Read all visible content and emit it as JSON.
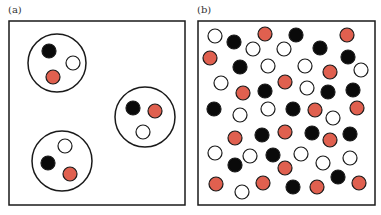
{
  "colors": {
    "black": "#0a0a0a",
    "white": "#ffffff",
    "red": "#e0604f",
    "stroke": "#1a1a1a"
  },
  "panels": [
    {
      "label": "(a)",
      "box": {
        "x": 9,
        "y": 21,
        "w": 176,
        "h": 184
      },
      "clusters": [
        {
          "cx": 57,
          "cy": 63,
          "r": 29,
          "particles": [
            {
              "x": 49,
              "y": 51,
              "type": "black"
            },
            {
              "x": 73,
              "y": 63,
              "type": "white"
            },
            {
              "x": 53,
              "y": 77,
              "type": "red"
            }
          ]
        },
        {
          "cx": 145,
          "cy": 117,
          "r": 30,
          "particles": [
            {
              "x": 133,
              "y": 108,
              "type": "black"
            },
            {
              "x": 155,
              "y": 111,
              "type": "red"
            },
            {
              "x": 143,
              "y": 132,
              "type": "white"
            }
          ]
        },
        {
          "cx": 62,
          "cy": 161,
          "r": 30,
          "particles": [
            {
              "x": 65,
              "y": 146,
              "type": "white"
            },
            {
              "x": 48,
              "y": 163,
              "type": "black"
            },
            {
              "x": 70,
              "y": 174,
              "type": "red"
            }
          ]
        }
      ]
    },
    {
      "label": "(b)",
      "box": {
        "x": 198,
        "y": 21,
        "w": 177,
        "h": 184
      },
      "particles": [
        {
          "x": 215,
          "y": 36,
          "type": "white"
        },
        {
          "x": 234,
          "y": 42,
          "type": "black"
        },
        {
          "x": 265,
          "y": 34,
          "type": "red"
        },
        {
          "x": 253,
          "y": 49,
          "type": "white"
        },
        {
          "x": 284,
          "y": 49,
          "type": "white"
        },
        {
          "x": 296,
          "y": 35,
          "type": "black"
        },
        {
          "x": 320,
          "y": 48,
          "type": "black"
        },
        {
          "x": 347,
          "y": 35,
          "type": "red"
        },
        {
          "x": 348,
          "y": 57,
          "type": "black"
        },
        {
          "x": 210,
          "y": 58,
          "type": "red"
        },
        {
          "x": 240,
          "y": 67,
          "type": "black"
        },
        {
          "x": 268,
          "y": 66,
          "type": "white"
        },
        {
          "x": 305,
          "y": 66,
          "type": "white"
        },
        {
          "x": 330,
          "y": 72,
          "type": "red"
        },
        {
          "x": 361,
          "y": 70,
          "type": "white"
        },
        {
          "x": 221,
          "y": 83,
          "type": "white"
        },
        {
          "x": 243,
          "y": 93,
          "type": "red"
        },
        {
          "x": 265,
          "y": 91,
          "type": "black"
        },
        {
          "x": 285,
          "y": 82,
          "type": "red"
        },
        {
          "x": 307,
          "y": 88,
          "type": "white"
        },
        {
          "x": 328,
          "y": 92,
          "type": "black"
        },
        {
          "x": 353,
          "y": 90,
          "type": "black"
        },
        {
          "x": 214,
          "y": 109,
          "type": "black"
        },
        {
          "x": 240,
          "y": 115,
          "type": "white"
        },
        {
          "x": 268,
          "y": 109,
          "type": "white"
        },
        {
          "x": 293,
          "y": 109,
          "type": "black"
        },
        {
          "x": 315,
          "y": 110,
          "type": "red"
        },
        {
          "x": 333,
          "y": 118,
          "type": "white"
        },
        {
          "x": 357,
          "y": 108,
          "type": "red"
        },
        {
          "x": 235,
          "y": 138,
          "type": "red"
        },
        {
          "x": 262,
          "y": 135,
          "type": "black"
        },
        {
          "x": 285,
          "y": 132,
          "type": "red"
        },
        {
          "x": 312,
          "y": 133,
          "type": "black"
        },
        {
          "x": 330,
          "y": 140,
          "type": "red"
        },
        {
          "x": 350,
          "y": 134,
          "type": "black"
        },
        {
          "x": 215,
          "y": 153,
          "type": "white"
        },
        {
          "x": 250,
          "y": 156,
          "type": "white"
        },
        {
          "x": 273,
          "y": 155,
          "type": "black"
        },
        {
          "x": 301,
          "y": 154,
          "type": "white"
        },
        {
          "x": 323,
          "y": 163,
          "type": "white"
        },
        {
          "x": 350,
          "y": 158,
          "type": "white"
        },
        {
          "x": 235,
          "y": 165,
          "type": "black"
        },
        {
          "x": 285,
          "y": 168,
          "type": "red"
        },
        {
          "x": 338,
          "y": 177,
          "type": "black"
        },
        {
          "x": 216,
          "y": 184,
          "type": "red"
        },
        {
          "x": 242,
          "y": 192,
          "type": "white"
        },
        {
          "x": 263,
          "y": 183,
          "type": "red"
        },
        {
          "x": 293,
          "y": 187,
          "type": "black"
        },
        {
          "x": 317,
          "y": 187,
          "type": "red"
        },
        {
          "x": 359,
          "y": 183,
          "type": "red"
        }
      ]
    }
  ],
  "particle_radius": 7
}
